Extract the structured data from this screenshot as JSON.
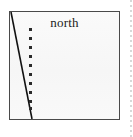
{
  "figure": {
    "title": "north",
    "background_color": "#f8f8f8",
    "border_color": "#4a4a4a",
    "page_background": "#ffffff"
  },
  "chart_data": {
    "type": "scatter",
    "title": "north",
    "xlabel": "",
    "ylabel": "",
    "grid": false,
    "legend": null,
    "xlim": [
      0,
      109
    ],
    "ylim": [
      0,
      107
    ],
    "series": [
      {
        "name": "marker-column",
        "type": "scatter",
        "marker": "square",
        "marker_color": "#2a2a2a",
        "marker_size": 3,
        "x": [
          19,
          19,
          19,
          19,
          19,
          19,
          19,
          19,
          19,
          19
        ],
        "y": [
          16,
          25,
          34,
          43,
          52,
          61,
          70,
          79,
          88,
          95
        ]
      },
      {
        "name": "boundary-line",
        "type": "line",
        "line_color": "#111111",
        "line_width": 1.6,
        "x": [
          1,
          22
        ],
        "y": [
          1,
          107
        ]
      }
    ]
  },
  "annotations": {
    "label_north": "north"
  },
  "markers": {
    "count": 10,
    "color": "#2a2a2a",
    "positions_y": [
      16,
      25,
      34,
      43,
      52,
      61,
      70,
      79,
      88,
      95
    ]
  }
}
